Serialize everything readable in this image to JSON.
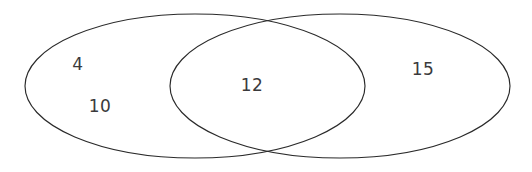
{
  "figure": {
    "type": "venn-diagram-2-set",
    "background_color": "#ffffff",
    "stroke_color": "#2a2a2a",
    "stroke_width": 1,
    "text_color": "#3a3a3c",
    "width": 532,
    "height": 172
  },
  "chart_data": {
    "type": "venn",
    "title": "",
    "xlabel": "",
    "ylabel": "",
    "set_count": 2,
    "regions": [
      {
        "region": "left-only",
        "values": [
          "4",
          "10"
        ]
      },
      {
        "region": "intersection",
        "values": [
          "12"
        ]
      },
      {
        "region": "right-only",
        "values": [
          "15"
        ]
      }
    ],
    "labels": [
      {
        "id": "left-only-a",
        "text": "4",
        "x": 78,
        "y": 64
      },
      {
        "id": "left-only-b",
        "text": "10",
        "x": 100,
        "y": 106
      },
      {
        "id": "intersection-a",
        "text": "12",
        "x": 252,
        "y": 85
      },
      {
        "id": "right-only-a",
        "text": "15",
        "x": 423,
        "y": 69
      }
    ],
    "ellipses": [
      {
        "id": "left-set",
        "cx": 195,
        "cy": 86,
        "rx": 170,
        "ry": 72
      },
      {
        "id": "right-set",
        "cx": 340,
        "cy": 86,
        "rx": 170,
        "ry": 72
      }
    ],
    "intersection_crossings": [
      {
        "x": 268,
        "y": 17
      },
      {
        "x": 268,
        "y": 157
      }
    ]
  },
  "values": {
    "left_only_top": "4",
    "left_only_bottom": "10",
    "intersection": "12",
    "right_only": "15"
  }
}
